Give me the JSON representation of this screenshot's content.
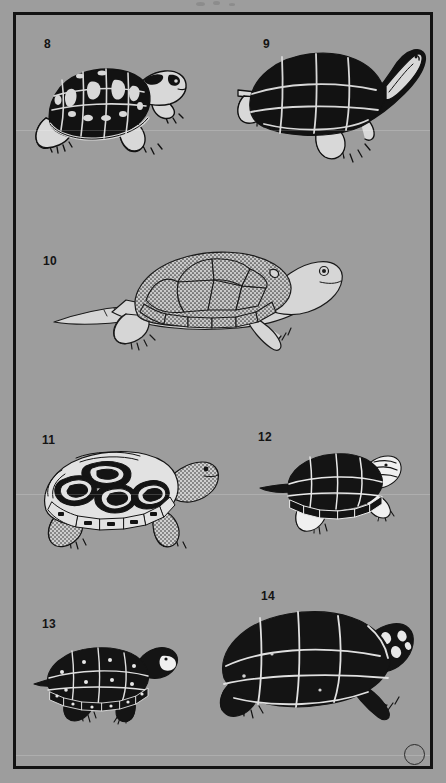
{
  "plate": {
    "background_color": "#9d9d9d",
    "border_color": "#131313",
    "ink_color": "#121212",
    "shell_light_color": "#d8d8d8",
    "width": 446,
    "height": 783,
    "corner_mark": "circle"
  },
  "figures": [
    {
      "number": "8",
      "label_x": 44,
      "label_y": 38,
      "name": "eastern-box-turtle",
      "style": "blotched-dark-shell-with-light-markings",
      "x": 28,
      "y": 48,
      "w": 168,
      "h": 112
    },
    {
      "number": "9",
      "label_x": 263,
      "label_y": 38,
      "name": "softshell-turtle-with-raised-head",
      "style": "solid-black-shell-light-seams",
      "x": 228,
      "y": 40,
      "w": 200,
      "h": 125
    },
    {
      "number": "10",
      "label_x": 43,
      "label_y": 255,
      "name": "snapping-turtle",
      "style": "stippled-light-shell-long-tail",
      "x": 58,
      "y": 240,
      "w": 290,
      "h": 125
    },
    {
      "number": "11",
      "label_x": 42,
      "label_y": 434,
      "name": "diamondback-terrapin",
      "style": "concentric-ringed-scutes-stippled-skin",
      "x": 38,
      "y": 444,
      "w": 180,
      "h": 110
    },
    {
      "number": "12",
      "label_x": 258,
      "label_y": 431,
      "name": "painted-turtle",
      "style": "dark-shell-light-seams-white-limbs",
      "x": 262,
      "y": 448,
      "w": 140,
      "h": 90
    },
    {
      "number": "13",
      "label_x": 42,
      "label_y": 618,
      "name": "spotted-turtle",
      "style": "black-shell-light-spots-and-seams",
      "x": 36,
      "y": 632,
      "w": 150,
      "h": 95
    },
    {
      "number": "14",
      "label_x": 261,
      "label_y": 590,
      "name": "mud-turtle",
      "style": "solid-black-shell-light-seams-large",
      "x": 212,
      "y": 604,
      "w": 200,
      "h": 125
    }
  ],
  "artifacts": {
    "scanlines": [
      {
        "y": 130
      },
      {
        "y": 494
      },
      {
        "y": 755
      }
    ],
    "top_smudges": [
      {
        "x": 196,
        "y": 2,
        "w": 9,
        "h": 4
      },
      {
        "x": 213,
        "y": 1,
        "w": 7,
        "h": 4
      },
      {
        "x": 229,
        "y": 3,
        "w": 6,
        "h": 3
      }
    ]
  }
}
